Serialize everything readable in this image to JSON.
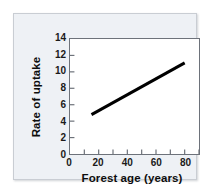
{
  "figure": {
    "panel_background": "#eef1f5",
    "panel_border": "#c9cdd3",
    "plot_background": "#ffffff",
    "axis_color": "#6d727a",
    "line_color": "#000000"
  },
  "chart_data": {
    "type": "line",
    "title": "",
    "xlabel": "Forest age (years)",
    "ylabel": "Rate of uptake",
    "xlim": [
      0,
      90
    ],
    "ylim": [
      0,
      14
    ],
    "xticks": [
      0,
      20,
      40,
      60,
      80
    ],
    "xticklabels": [
      "0",
      "20",
      "40",
      "60",
      "80"
    ],
    "xminorticks": [
      10,
      30,
      50,
      70,
      90
    ],
    "yticks": [
      0,
      2,
      4,
      6,
      8,
      10,
      12,
      14
    ],
    "yticklabels": [
      "0",
      "2",
      "4",
      "6",
      "8",
      "10",
      "12",
      "14"
    ],
    "grid": false,
    "legend": null,
    "series": [
      {
        "name": "Rate of uptake",
        "color": "#000000",
        "linewidth": 3,
        "x": [
          15,
          80
        ],
        "y": [
          4.8,
          11.1
        ]
      }
    ]
  }
}
